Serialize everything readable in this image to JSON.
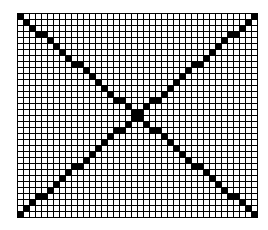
{
  "diagram": {
    "type": "pixel-grid",
    "cols": 40,
    "rows": 34,
    "cell_size_px": 5,
    "gap_px": 1,
    "line_color": "#000000",
    "fill_color": "#000000",
    "empty_color": "#ffffff",
    "lines": [
      {
        "name": "main-diagonal",
        "from": "top-left",
        "to": "bottom-right"
      },
      {
        "name": "anti-diagonal",
        "from": "bottom-left",
        "to": "top-right"
      }
    ]
  }
}
